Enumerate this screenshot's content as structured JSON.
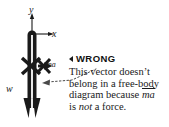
{
  "figure": {
    "type": "free-body-diagram-annotated",
    "background_color": "#ffffff",
    "ink_color": "#1a1a1a"
  },
  "diagram": {
    "axes": {
      "y_label": "y",
      "x_label": "x",
      "y_direction": "up",
      "x_direction": "right"
    },
    "body": {
      "name": "vertical-bar-object",
      "orientation": "vertical"
    },
    "vectors": [
      {
        "name": "weight-vector",
        "label": "w",
        "direction": "down",
        "crossed_out": false
      },
      {
        "name": "ma-vector",
        "label": "ma",
        "direction": "right",
        "crossed_out": true
      },
      {
        "name": "crossed-vector-left",
        "label": "",
        "direction": "left",
        "crossed_out": true
      }
    ]
  },
  "callout": {
    "marker_icon": "left-triangle-icon",
    "heading": "WRONG",
    "body_lines": [
      "This vector doesn’t",
      "belong in a free-body",
      "diagram because"
    ],
    "inline_math": "ma",
    "closing_prefix": "is",
    "closing_emphasis": "not",
    "closing_suffix": "a force.",
    "leader_line_style": "dotted-with-arrowhead",
    "leader_arrow_direction": "left"
  }
}
